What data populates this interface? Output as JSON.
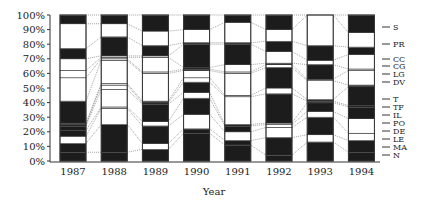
{
  "chart_data": {
    "type": "bar",
    "stacked": true,
    "normalized": true,
    "title": "",
    "xlabel": "Year",
    "ylabel": "",
    "ylim": [
      0,
      100
    ],
    "ytick_labels": [
      "0%",
      "10%",
      "20%",
      "30%",
      "40%",
      "50%",
      "60%",
      "70%",
      "80%",
      "90%",
      "100%"
    ],
    "categories": [
      "1987",
      "1988",
      "1989",
      "1990",
      "1991",
      "1992",
      "1993",
      "1994"
    ],
    "legend_position": "right",
    "grid": false,
    "series": [
      {
        "name": "N",
        "values": [
          6,
          6,
          8,
          19,
          11,
          4,
          13,
          6
        ]
      },
      {
        "name": "MA",
        "values": [
          6,
          19,
          4,
          3,
          3,
          12,
          5,
          8
        ]
      },
      {
        "name": "LE",
        "values": [
          5,
          11,
          12,
          10,
          6,
          7,
          12,
          5
        ]
      },
      {
        "name": "DE",
        "values": [
          4,
          1,
          3,
          11,
          4,
          2,
          4,
          10
        ]
      },
      {
        "name": "PO",
        "values": [
          3,
          12,
          12,
          4,
          1,
          1,
          6,
          8
        ]
      },
      {
        "name": "IL",
        "values": [
          1,
          3,
          1,
          7,
          19,
          20,
          1,
          1
        ]
      },
      {
        "name": "TF",
        "values": [
          1,
          1,
          1,
          3,
          1,
          4,
          1,
          13
        ]
      },
      {
        "name": "T",
        "values": [
          15,
          16,
          19,
          5,
          15,
          14,
          13,
          1
        ]
      },
      {
        "name": "DV",
        "values": [
          16,
          1,
          1,
          1,
          1,
          2,
          1,
          10
        ]
      },
      {
        "name": "LG",
        "values": [
          5,
          1,
          10,
          1,
          5,
          1,
          10,
          1
        ]
      },
      {
        "name": "CG",
        "values": [
          8,
          1,
          1,
          16,
          14,
          8,
          3,
          10
        ]
      },
      {
        "name": "CC",
        "values": [
          7,
          13,
          7,
          1,
          1,
          7,
          10,
          5
        ]
      },
      {
        "name": "PR",
        "values": [
          17,
          9,
          10,
          9,
          14,
          8,
          21,
          10
        ]
      },
      {
        "name": "S",
        "values": [
          6,
          6,
          11,
          10,
          5,
          10,
          0,
          12
        ]
      }
    ],
    "fills": {
      "1987": [
        "#1c1c1c",
        "#1c1c1c",
        "#ffffff",
        "#1c1c1c",
        "#1c1c1c",
        "#1c1c1c",
        "#1c1c1c",
        "#1c1c1c",
        "#ffffff",
        "#ffffff",
        "#ffffff",
        "#1c1c1c",
        "#ffffff",
        "#1c1c1c"
      ],
      "1988": [
        "#1c1c1c",
        "#1c1c1c",
        "#ffffff",
        "#ffffff",
        "#ffffff",
        "#ffffff",
        "#ffffff",
        "#ffffff",
        "#ffffff",
        "#ffffff",
        "#ffffff",
        "#1c1c1c",
        "#ffffff",
        "#1c1c1c"
      ],
      "1989": [
        "#1c1c1c",
        "#ffffff",
        "#1c1c1c",
        "#ffffff",
        "#1c1c1c",
        "#1c1c1c",
        "#1c1c1c",
        "#ffffff",
        "#ffffff",
        "#ffffff",
        "#ffffff",
        "#1c1c1c",
        "#ffffff",
        "#1c1c1c"
      ],
      "1990": [
        "#1c1c1c",
        "#1c1c1c",
        "#ffffff",
        "#1c1c1c",
        "#ffffff",
        "#1c1c1c",
        "#ffffff",
        "#ffffff",
        "#1c1c1c",
        "#1c1c1c",
        "#1c1c1c",
        "#1c1c1c",
        "#ffffff",
        "#1c1c1c"
      ],
      "1991": [
        "#1c1c1c",
        "#1c1c1c",
        "#ffffff",
        "#1c1c1c",
        "#1c1c1c",
        "#ffffff",
        "#ffffff",
        "#ffffff",
        "#ffffff",
        "#ffffff",
        "#1c1c1c",
        "#1c1c1c",
        "#ffffff",
        "#1c1c1c"
      ],
      "1992": [
        "#1c1c1c",
        "#1c1c1c",
        "#ffffff",
        "#ffffff",
        "#ffffff",
        "#1c1c1c",
        "#ffffff",
        "#1c1c1c",
        "#ffffff",
        "#1c1c1c",
        "#ffffff",
        "#1c1c1c",
        "#ffffff",
        "#1c1c1c"
      ],
      "1993": [
        "#1c1c1c",
        "#ffffff",
        "#1c1c1c",
        "#ffffff",
        "#1c1c1c",
        "#1c1c1c",
        "#1c1c1c",
        "#ffffff",
        "#ffffff",
        "#1c1c1c",
        "#ffffff",
        "#1c1c1c",
        "#ffffff",
        "#1c1c1c"
      ],
      "1994": [
        "#1c1c1c",
        "#1c1c1c",
        "#ffffff",
        "#ffffff",
        "#1c1c1c",
        "#1c1c1c",
        "#1c1c1c",
        "#1c1c1c",
        "#ffffff",
        "#ffffff",
        "#ffffff",
        "#1c1c1c",
        "#ffffff",
        "#1c1c1c"
      ]
    },
    "legend": {
      "labels": [
        "S",
        "PR",
        "CC",
        "CG",
        "LG",
        "DV",
        "T",
        "TF",
        "IL",
        "PO",
        "DE",
        "LE",
        "MA",
        "N"
      ],
      "y_positions": [
        27,
        44,
        59,
        66,
        74,
        82,
        99,
        107,
        115,
        123,
        131,
        139,
        147,
        155
      ]
    }
  }
}
